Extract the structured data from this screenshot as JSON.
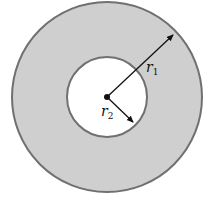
{
  "diagram": {
    "colors": {
      "ring_fill": "#cfcfcf",
      "ring_stroke": "#707070",
      "inner_fill": "#ffffff",
      "arrow": "#111111"
    },
    "outer_circle": {
      "cx": 107,
      "cy": 97,
      "r": 95
    },
    "inner_circle": {
      "cx": 107,
      "cy": 97,
      "r": 40
    },
    "labels": {
      "r1": {
        "base": "r",
        "subscript": "1"
      },
      "r2": {
        "base": "r",
        "subscript": "2"
      }
    }
  }
}
